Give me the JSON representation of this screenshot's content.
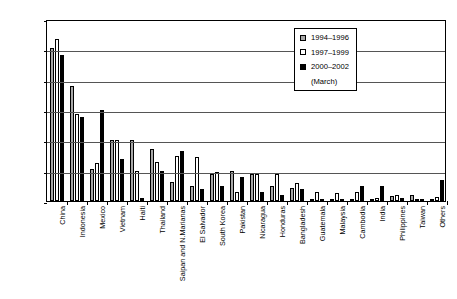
{
  "chart_data": {
    "type": "bar",
    "title": "",
    "subtitle": "",
    "xlabel": "",
    "ylabel": "",
    "ylim": [
      0,
      0.3
    ],
    "ytick_labels": [
      "30.00%",
      "25.00%",
      "20.00%",
      "15.00%",
      "10.00%",
      "5.00%",
      "0.00%"
    ],
    "ytick_values": [
      0.3,
      0.25,
      0.2,
      0.15,
      0.1,
      0.05,
      0.0
    ],
    "grid": true,
    "legend_position": "top-right",
    "categories": [
      "China",
      "Indonesia",
      "Mexico",
      "Vietnam",
      "Haiti",
      "Thailand",
      "Saipan and N.Marianas",
      "El Salvador",
      "South Korea",
      "Pakistan",
      "Nicaragua",
      "Honduras",
      "Bangladesh",
      "Guatemala",
      "Malaysia",
      "Cambodia",
      "India",
      "Philippines",
      "Taiwan",
      "Others"
    ],
    "series": [
      {
        "name": "1994–1996",
        "color": "#a8a8a8",
        "values": [
          0.252,
          0.19,
          0.053,
          0.1,
          0.1,
          0.085,
          0.032,
          0.025,
          0.045,
          0.05,
          0.045,
          0.025,
          0.022,
          0.004,
          0.004,
          0.003,
          0.004,
          0.009,
          0.01,
          0.003
        ]
      },
      {
        "name": "1997–1999",
        "color": "#ffffff",
        "values": [
          0.267,
          0.143,
          0.062,
          0.1,
          0.05,
          0.065,
          0.075,
          0.073,
          0.048,
          0.015,
          0.045,
          0.045,
          0.03,
          0.015,
          0.013,
          0.015,
          0.005,
          0.01,
          0.004,
          0.006
        ]
      },
      {
        "name": "2000–2002 (March)",
        "color": "#000000",
        "values": [
          0.24,
          0.138,
          0.15,
          0.07,
          0.005,
          0.05,
          0.083,
          0.02,
          0.025,
          0.04,
          0.015,
          0.01,
          0.02,
          0.002,
          0.002,
          0.024,
          0.025,
          0.005,
          0.003,
          0.035
        ]
      }
    ]
  },
  "legend": {
    "entries": [
      {
        "label": "1994–1996"
      },
      {
        "label": "1997–1999"
      },
      {
        "label": "2000–2002"
      }
    ],
    "third_sublabel": "(March)"
  }
}
